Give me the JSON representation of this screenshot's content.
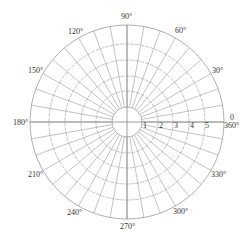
{
  "diagram": {
    "type": "polar-grid",
    "center": {
      "x": 127,
      "y": 122
    },
    "hub_radius": 15,
    "rings": [
      {
        "value": "1",
        "radius": 31
      },
      {
        "value": "2",
        "radius": 46
      },
      {
        "value": "3",
        "radius": 62
      },
      {
        "value": "4",
        "radius": 78
      },
      {
        "value": "5",
        "radius": 97
      }
    ],
    "spoke_step_deg": 10,
    "radial_labels": [
      "1",
      "2",
      "3",
      "4",
      "5"
    ],
    "angle_labels": [
      {
        "deg": 0,
        "text": "0"
      },
      {
        "deg": 0,
        "text": "360°",
        "secondary": true
      },
      {
        "deg": 30,
        "text": "30°"
      },
      {
        "deg": 60,
        "text": "60°"
      },
      {
        "deg": 90,
        "text": "90°"
      },
      {
        "deg": 120,
        "text": "120°"
      },
      {
        "deg": 150,
        "text": "150°"
      },
      {
        "deg": 180,
        "text": "180°"
      },
      {
        "deg": 210,
        "text": "210°"
      },
      {
        "deg": 240,
        "text": "240°"
      },
      {
        "deg": 270,
        "text": "270°"
      },
      {
        "deg": 300,
        "text": "300°"
      },
      {
        "deg": 330,
        "text": "330°"
      }
    ],
    "colors": {
      "grid": "#9a9a9a",
      "axis": "#777777",
      "text": "#333333",
      "background": "#ffffff"
    }
  }
}
